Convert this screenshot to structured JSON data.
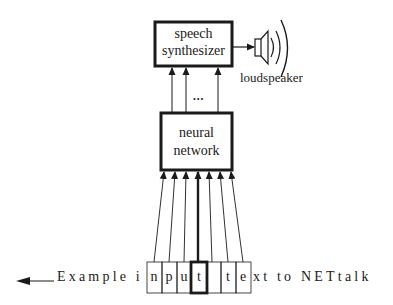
{
  "diagram": {
    "nodes": {
      "synthesizer": {
        "line1": "speech",
        "line2": "synthesizer"
      },
      "network": {
        "line1": "neural",
        "line2": "network"
      },
      "loudspeaker": {
        "label": "loudspeaker"
      }
    },
    "ellipsis": "•••",
    "input_text": {
      "prefix": "Example i",
      "cells": [
        "n",
        "p",
        "u",
        "t",
        " ",
        "t",
        "e"
      ],
      "focus_index": 3,
      "suffix": "xt to NETtalk"
    },
    "colors": {
      "stroke": "#1a1a1a",
      "background": "#ffffff"
    }
  }
}
